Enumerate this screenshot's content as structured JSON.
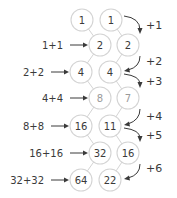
{
  "diagram": {
    "left_column": [
      "1",
      "2",
      "4",
      "8",
      "16",
      "32",
      "64"
    ],
    "right_column": [
      "1",
      "2",
      "4",
      "7",
      "11",
      "16",
      "22"
    ],
    "doubling_labels": [
      "1+1",
      "2+2",
      "4+4",
      "8+8",
      "16+16",
      "32+32"
    ],
    "increment_labels": [
      "+1",
      "+2",
      "+3",
      "+4",
      "+5",
      "+6"
    ]
  }
}
